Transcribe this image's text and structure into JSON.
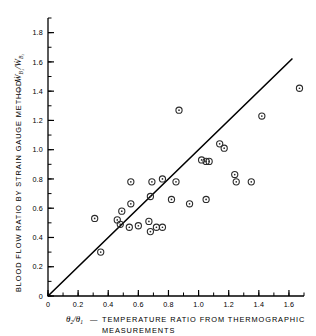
{
  "chart_data": {
    "type": "scatter",
    "title": "",
    "xlabel": "θ₂/θ₁ — TEMPERATURE RATIO FROM THERMOGRAPHIC MEASUREMENTS",
    "ylabel": "BLOOD FLOW RATIO BY STRAIN GAUGE METHOD — ẆB₁/ẆB₂",
    "xlim": [
      0,
      1.7
    ],
    "ylim": [
      0,
      1.9
    ],
    "xticks": [
      0,
      0.2,
      0.4,
      0.6,
      0.8,
      1.0,
      1.2,
      1.4,
      1.6
    ],
    "yticks": [
      0,
      0.2,
      0.4,
      0.6,
      0.8,
      1.0,
      1.2,
      1.4,
      1.6,
      1.8
    ],
    "xtick_labels": [
      "0",
      "0.2",
      "0.4",
      "0.6",
      "0.8",
      "1.0",
      "1.2",
      "1.4",
      "1.6"
    ],
    "ytick_labels": [
      "0",
      "0.2",
      "0.4",
      "0.6",
      "0.8",
      "1.0",
      "1.2",
      "1.4",
      "1.6",
      "1.8"
    ],
    "minor_tick_step": 0.1,
    "grid": false,
    "legend": null,
    "marker": "open-circle-with-center-dot",
    "series": [
      {
        "name": "Blood flow ratio vs temperature ratio",
        "points": [
          [
            0.31,
            0.53
          ],
          [
            0.35,
            0.3
          ],
          [
            0.46,
            0.52
          ],
          [
            0.48,
            0.49
          ],
          [
            0.49,
            0.58
          ],
          [
            0.54,
            0.47
          ],
          [
            0.55,
            0.63
          ],
          [
            0.55,
            0.78
          ],
          [
            0.6,
            0.48
          ],
          [
            0.67,
            0.51
          ],
          [
            0.68,
            0.44
          ],
          [
            0.68,
            0.68
          ],
          [
            0.69,
            0.78
          ],
          [
            0.72,
            0.47
          ],
          [
            0.76,
            0.47
          ],
          [
            0.76,
            0.8
          ],
          [
            0.82,
            0.66
          ],
          [
            0.85,
            0.78
          ],
          [
            0.87,
            1.27
          ],
          [
            0.94,
            0.63
          ],
          [
            1.02,
            0.93
          ],
          [
            1.05,
            0.66
          ],
          [
            1.05,
            0.92
          ],
          [
            1.07,
            0.92
          ],
          [
            1.14,
            1.04
          ],
          [
            1.17,
            1.01
          ],
          [
            1.24,
            0.83
          ],
          [
            1.25,
            0.78
          ],
          [
            1.35,
            0.78
          ],
          [
            1.42,
            1.23
          ],
          [
            1.67,
            1.42
          ]
        ]
      }
    ],
    "fit_line": {
      "description": "straight reference line through origin",
      "x_start": 0.0,
      "y_start": 0.0,
      "x_end": 1.62,
      "y_end": 1.62,
      "slope": 1.0,
      "intercept": 0.0
    },
    "annotations": []
  },
  "axes": {
    "x_title_symbol_num": "θ",
    "x_title_symbol_num_sub": "2",
    "x_title_symbol_den": "θ",
    "x_title_symbol_den_sub": "1",
    "x_title_dash": "—",
    "x_title_line1": "TEMPERATURE   RATIO   FROM   THERMOGRAPHIC",
    "x_title_line2": "MEASUREMENTS",
    "y_title_words": "BLOOD  FLOW  RATIO  BY  STRAIN  GAUGE  METHOD",
    "y_title_dash": "—",
    "y_title_symbol_num": "Ẇ",
    "y_title_symbol_num_sub": "B₁",
    "y_title_symbol_den": "Ẇ",
    "y_title_symbol_den_sub": "B₂"
  },
  "colors": {
    "ink": "#000000",
    "marker": "#2b2b2b",
    "background": "#ffffff"
  }
}
